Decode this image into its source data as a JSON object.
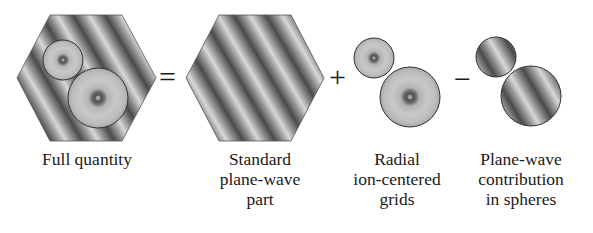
{
  "diagram": {
    "terms": [
      {
        "id": "full",
        "label_lines": [
          "Full quantity"
        ],
        "shape": "hexagon-with-spheres"
      },
      {
        "id": "plane-wave",
        "label_lines": [
          "Standard",
          "plane-wave",
          "part"
        ],
        "shape": "hexagon"
      },
      {
        "id": "radial",
        "label_lines": [
          "Radial",
          "ion-centered",
          "grids"
        ],
        "shape": "radial-spheres"
      },
      {
        "id": "plane-wave-in-spheres",
        "label_lines": [
          "Plane-wave",
          "contribution",
          "in spheres"
        ],
        "shape": "plane-wave-spheres"
      }
    ],
    "operators": [
      "=",
      "+",
      "−"
    ]
  }
}
